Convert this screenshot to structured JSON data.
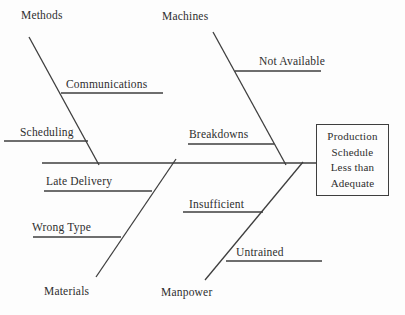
{
  "diagram": {
    "type": "fishbone-cause-effect",
    "effect": {
      "text": "Production Schedule Less than Adequate",
      "lines": [
        "Production",
        "Schedule",
        "Less than",
        "Adequate"
      ]
    },
    "categories": [
      {
        "label": "Methods",
        "position": "top-left",
        "causes": [
          "Communications",
          "Scheduling"
        ]
      },
      {
        "label": "Machines",
        "position": "top-right",
        "causes": [
          "Not Available",
          "Breakdowns"
        ]
      },
      {
        "label": "Materials",
        "position": "bottom-left",
        "causes": [
          "Late Delivery",
          "Wrong Type"
        ]
      },
      {
        "label": "Manpower",
        "position": "bottom-right",
        "causes": [
          "Insufficient",
          "Untrained"
        ]
      }
    ],
    "colors": {
      "line": "#3e3e3e",
      "text": "#2e2e2e",
      "background": "#fdfdfd"
    }
  }
}
